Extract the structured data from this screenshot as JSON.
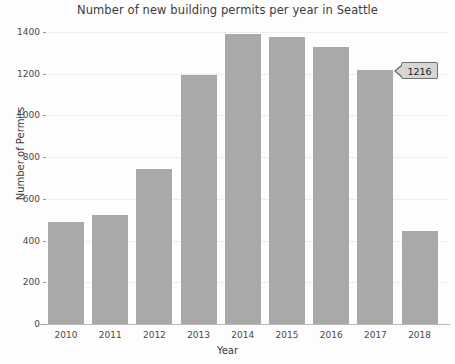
{
  "chart_data": {
    "type": "bar",
    "title": "Number of new building permits per year in Seattle",
    "xlabel": "Year",
    "ylabel": "Number of Permits",
    "categories": [
      "2010",
      "2011",
      "2012",
      "2013",
      "2014",
      "2015",
      "2016",
      "2017",
      "2018"
    ],
    "values": [
      489,
      522,
      743,
      1194,
      1391,
      1374,
      1330,
      1216,
      446
    ],
    "ylim": [
      0,
      1400
    ],
    "yticks": [
      0,
      200,
      400,
      600,
      800,
      1000,
      1200,
      1400
    ],
    "ytick_labels": [
      "0",
      "200",
      "400",
      "600",
      "800",
      "1000",
      "1200",
      "1400"
    ],
    "grid": true,
    "legend": null,
    "bar_color": "#a9a9a9",
    "annotations": [
      {
        "type": "tooltip",
        "text": "1216",
        "attached_to_category": "2017",
        "value": 1216,
        "background": "#d6d6d6",
        "border": "#6e6e6e"
      }
    ]
  }
}
